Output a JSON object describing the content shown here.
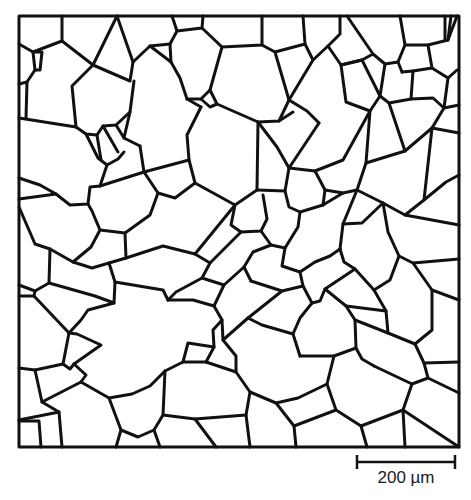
{
  "figure": {
    "type": "grain-boundary micrograph sketch",
    "frame": {
      "x1": 19,
      "y1": 16,
      "x2": 459,
      "y2": 447
    },
    "line_color": "#111111",
    "background": "#ffffff"
  },
  "scale_bar": {
    "label": "200 µm",
    "x1": 357,
    "x2": 455,
    "y": 462
  }
}
